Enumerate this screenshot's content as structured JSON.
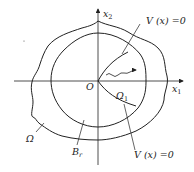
{
  "diagram": {
    "type": "region-diagram",
    "axes": {
      "x_label": "x",
      "x_sub": "1",
      "y_label": "x",
      "y_sub": "2",
      "origin_label": "O"
    },
    "labels": {
      "outer_region": "Ω",
      "ball": "B",
      "ball_sub": "r",
      "subregion": "Ω",
      "subregion_sub": "1",
      "curve_top": "V (x) =0",
      "curve_bottom": "V (x) =0"
    },
    "colors": {
      "stroke": "#222222",
      "background": "#ffffff"
    }
  }
}
